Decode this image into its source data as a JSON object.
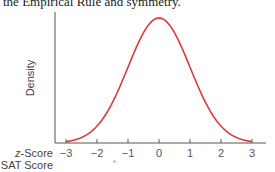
{
  "caption": "the Empirical Rule and symmetry.",
  "chart_data": {
    "type": "line",
    "title": "",
    "xlabel": "z-Score",
    "xlabel_secondary": "SAT Score",
    "ylabel": "Density",
    "x_ticks": [
      -3,
      -2,
      -1,
      0,
      1,
      2,
      3
    ],
    "x_tick_labels": [
      "−3",
      "−2",
      "−1",
      "0",
      "1",
      "2",
      "3"
    ],
    "xlim": [
      -3.35,
      3.45
    ],
    "ylim": [
      0,
      0.42
    ],
    "grid": false,
    "legend": null,
    "series": [
      {
        "name": "Standard normal density",
        "color": "#d93a3a",
        "x": [
          -3,
          -2.5,
          -2,
          -1.5,
          -1,
          -0.5,
          0,
          0.5,
          1,
          1.5,
          2,
          2.5,
          3
        ],
        "values": [
          0.004,
          0.018,
          0.054,
          0.13,
          0.242,
          0.352,
          0.399,
          0.352,
          0.242,
          0.13,
          0.054,
          0.018,
          0.004
        ]
      }
    ]
  },
  "labels": {
    "z_row_prefix": "z",
    "z_row_suffix": "-Score",
    "sat_row": "SAT Score",
    "y_axis": "Density",
    "ticks": [
      "−3",
      "−2",
      "−1",
      "0",
      "1",
      "2",
      "3"
    ]
  },
  "colors": {
    "curve": "#d93a3a",
    "axis": "#555555"
  }
}
